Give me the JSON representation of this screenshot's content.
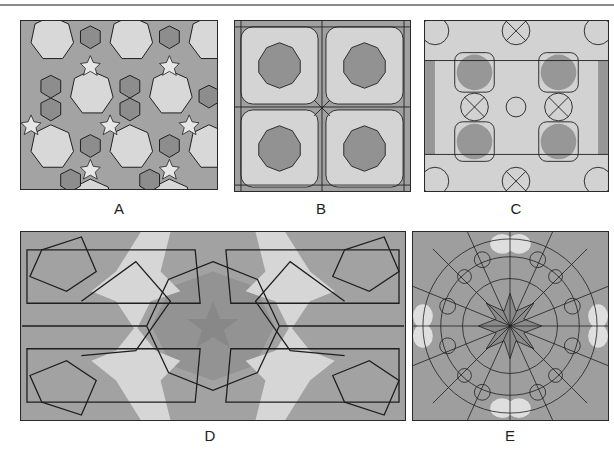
{
  "figure": {
    "panels": [
      {
        "id": "A",
        "label": "A",
        "description": "Periodic pattern with 8-fold rosettes (light octagons), hexagons and five-pointed stars"
      },
      {
        "id": "B",
        "label": "B",
        "description": "Square-grid pattern with dark 8-pointed star centers surrounded by light elongated hexagons"
      },
      {
        "id": "C",
        "label": "C",
        "description": "Dense pattern of circular rosettes with crossed centers and dark octagonal stars"
      },
      {
        "id": "D",
        "label": "D",
        "description": "Wide pattern with central 10-pointed star, pentagons, light six-pointed stars and decagonal outlines"
      },
      {
        "id": "E",
        "label": "E",
        "description": "Radial rosette with 16-fold central star, surrounding kite shapes and small hexagon ring"
      }
    ],
    "colors": {
      "dark_fill": "#8f8f8f",
      "mid_fill": "#a8a8a8",
      "light_fill": "#d6d6d6",
      "line": "#1e1e1e",
      "border": "#2a2a2a"
    }
  }
}
